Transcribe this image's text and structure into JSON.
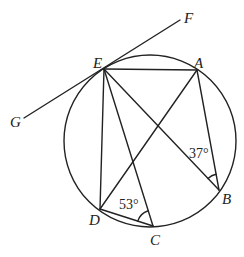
{
  "diagram": {
    "circle": {
      "cx": 150,
      "cy": 141,
      "r": 86
    },
    "points": {
      "E": {
        "label": "E",
        "x": 104,
        "y": 69,
        "lx": 93,
        "ly": 68
      },
      "A": {
        "label": "A",
        "x": 197,
        "y": 70,
        "lx": 194,
        "ly": 68
      },
      "B": {
        "label": "B",
        "x": 219,
        "y": 190,
        "lx": 222,
        "ly": 204
      },
      "C": {
        "label": "C",
        "x": 153,
        "y": 226,
        "lx": 150,
        "ly": 245
      },
      "D": {
        "label": "D",
        "x": 100,
        "y": 209,
        "lx": 89,
        "ly": 225
      },
      "F": {
        "label": "F",
        "x": 180,
        "y": 20,
        "lx": 184,
        "ly": 23
      },
      "G": {
        "label": "G",
        "x": 24,
        "y": 118,
        "lx": 10,
        "ly": 127
      }
    },
    "segments": [
      [
        "G",
        "F"
      ],
      [
        "E",
        "A"
      ],
      [
        "E",
        "D"
      ],
      [
        "E",
        "C"
      ],
      [
        "E",
        "B"
      ],
      [
        "A",
        "D"
      ],
      [
        "A",
        "B"
      ],
      [
        "D",
        "C"
      ]
    ],
    "angles": [
      {
        "vertex": "C",
        "label": "53°",
        "lx": 119,
        "ly": 209
      },
      {
        "vertex": "B",
        "label": "37°",
        "lx": 189,
        "ly": 158
      }
    ]
  }
}
